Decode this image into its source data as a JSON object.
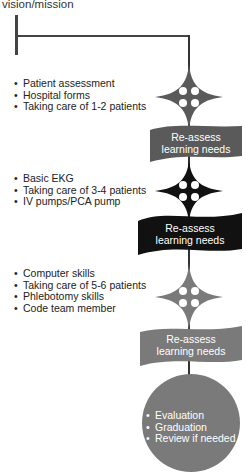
{
  "header": {
    "label": "vision/mission"
  },
  "stages": [
    {
      "items": [
        "Patient assessment",
        "Hospital forms",
        "Taking care of 1-2 patients"
      ],
      "banner": "Re-assess learning needs",
      "banner_line1": "Re-assess",
      "banner_line2": "learning needs",
      "color": "#5a5a5a"
    },
    {
      "items": [
        "Basic EKG",
        "Taking care of 3-4 patients",
        "IV pumps/PCA pump"
      ],
      "banner": "Re-assess learning needs",
      "banner_line1": "Re-assess",
      "banner_line2": "learning needs",
      "color": "#111111"
    },
    {
      "items": [
        "Computer skills",
        "Taking care of 5-6 patients",
        "Phlebotomy skills",
        "Code team member"
      ],
      "banner": "Re-assess learning needs",
      "banner_line1": "Re-assess",
      "banner_line2": "learning needs",
      "color": "#7a7a7a"
    }
  ],
  "final": {
    "items": [
      "Evaluation",
      "Graduation",
      "Review if needed"
    ],
    "color": "#7a7a7a"
  },
  "colors": {
    "connector": "#444444",
    "background": "#ffffff"
  }
}
